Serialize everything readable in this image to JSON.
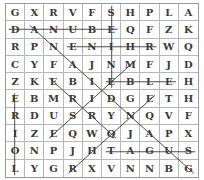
{
  "puzzle": {
    "type": "word-search",
    "rows": 10,
    "cols": 10,
    "grid": [
      [
        "G",
        "X",
        "R",
        "V",
        "F",
        "S",
        "H",
        "P",
        "L",
        "A"
      ],
      [
        "D",
        "A",
        "N",
        "U",
        "B",
        "E",
        "Q",
        "F",
        "Z",
        "K"
      ],
      [
        "R",
        "P",
        "N",
        "E",
        "N",
        "I",
        "H",
        "R",
        "W",
        "Q"
      ],
      [
        "C",
        "Y",
        "F",
        "A",
        "J",
        "N",
        "M",
        "F",
        "J",
        "D"
      ],
      [
        "Z",
        "K",
        "E",
        "B",
        "I",
        "E",
        "B",
        "L",
        "E",
        "H"
      ],
      [
        "E",
        "B",
        "M",
        "R",
        "I",
        "D",
        "G",
        "E",
        "T",
        "H"
      ],
      [
        "R",
        "D",
        "U",
        "S",
        "R",
        "Y",
        "N",
        "Q",
        "V",
        "F"
      ],
      [
        "I",
        "Z",
        "E",
        "Q",
        "W",
        "Q",
        "J",
        "A",
        "P",
        "X"
      ],
      [
        "O",
        "N",
        "P",
        "J",
        "H",
        "T",
        "A",
        "G",
        "U",
        "S"
      ],
      [
        "L",
        "Y",
        "G",
        "R",
        "X",
        "V",
        "N",
        "N",
        "B",
        "G"
      ]
    ],
    "found_lines": [
      {
        "word": "DANUBE",
        "from": [
          1,
          0
        ],
        "to": [
          1,
          5
        ]
      },
      {
        "word": "RHINE",
        "from": [
          2,
          7
        ],
        "to": [
          2,
          3
        ]
      },
      {
        "word": "ELBE",
        "from": [
          4,
          8
        ],
        "to": [
          4,
          5
        ]
      },
      {
        "word": "TAGUS",
        "from": [
          8,
          5
        ],
        "to": [
          8,
          9
        ]
      },
      {
        "word": "SEINE",
        "from": [
          0,
          5
        ],
        "to": [
          4,
          5
        ]
      },
      {
        "word": "LOIRE",
        "from": [
          9,
          0
        ],
        "to": [
          5,
          0
        ]
      },
      {
        "word": "",
        "from": [
          1,
          1
        ],
        "to": [
          9,
          9
        ]
      },
      {
        "word": "",
        "from": [
          4,
          2
        ],
        "to": [
          7,
          5
        ]
      },
      {
        "word": "",
        "from": [
          7,
          2
        ],
        "to": [
          3,
          6
        ]
      },
      {
        "word": "",
        "from": [
          9,
          3
        ],
        "to": [
          5,
          7
        ]
      }
    ],
    "line_color": "#3a3a3a"
  }
}
